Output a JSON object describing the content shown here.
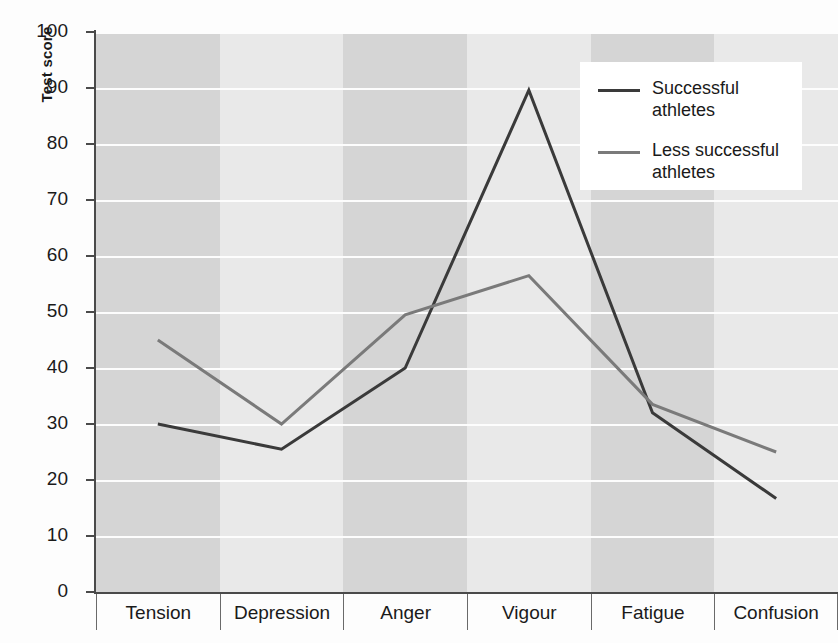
{
  "chart_data": {
    "type": "line",
    "title": "",
    "xlabel": "",
    "ylabel": "Test score",
    "ylim": [
      0,
      100
    ],
    "yticks": [
      0,
      10,
      20,
      30,
      40,
      50,
      60,
      70,
      80,
      90,
      100
    ],
    "grid": true,
    "legend_position": "top-right",
    "categories": [
      "Tension",
      "Depression",
      "Anger",
      "Vigour",
      "Fatigue",
      "Confusion"
    ],
    "series": [
      {
        "name": "Successful athletes",
        "color": "#3a3a3a",
        "values": [
          30,
          25.5,
          40,
          89.6,
          32,
          16.7
        ]
      },
      {
        "name": "Less successful athletes",
        "color": "#7a7a7a",
        "values": [
          45,
          30,
          49.5,
          56.5,
          33.5,
          25
        ]
      }
    ],
    "band_colors": [
      "#d5d5d5",
      "#e9e9e9"
    ],
    "gridline_color": "#fdfdfd",
    "axis_color": "#4a4a4a"
  },
  "legend": {
    "items": [
      {
        "label_line1": "Successful",
        "label_line2": "athletes"
      },
      {
        "label_line1": "Less successful",
        "label_line2": "athletes"
      }
    ]
  }
}
